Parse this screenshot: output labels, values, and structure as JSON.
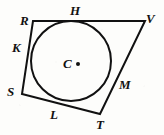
{
  "figure": {
    "background_color": "#fdfdfb",
    "stroke_color": "#111111",
    "canvas": {
      "width": 164,
      "height": 135
    }
  },
  "chart_data": {
    "type": "diagram",
    "shapes": [
      {
        "name": "circle",
        "kind": "circle",
        "center": [
          71,
          61
        ],
        "radius": 40,
        "stroke": "#111111",
        "stroke_width": 2,
        "fill": "none"
      },
      {
        "name": "quadrilateral",
        "kind": "polygon",
        "vertices": [
          [
            33,
            21
          ],
          [
            145,
            21
          ],
          [
            100,
            114
          ],
          [
            22,
            94
          ]
        ],
        "stroke": "#111111",
        "stroke_width": 2,
        "fill": "none"
      },
      {
        "name": "center-dot",
        "kind": "point",
        "position": [
          78,
          64
        ],
        "radius": 2,
        "fill": "#111111"
      }
    ],
    "points": [
      {
        "id": "R",
        "label": "R",
        "role": "vertex",
        "position": [
          33,
          21
        ],
        "label_position": [
          20,
          14
        ]
      },
      {
        "id": "H",
        "label": "H",
        "role": "tangent-point",
        "position": [
          77,
          21
        ],
        "label_position": [
          70,
          4
        ]
      },
      {
        "id": "V",
        "label": "V",
        "role": "vertex",
        "position": [
          145,
          21
        ],
        "label_position": [
          146,
          12
        ]
      },
      {
        "id": "K",
        "label": "K",
        "role": "tangent-point",
        "position": [
          31,
          49
        ],
        "label_position": [
          12,
          41
        ]
      },
      {
        "id": "C",
        "label": "C",
        "role": "center",
        "position": [
          71,
          61
        ],
        "label_position": [
          63,
          57
        ]
      },
      {
        "id": "M",
        "label": "M",
        "role": "tangent-point",
        "position": [
          113,
          84
        ],
        "label_position": [
          119,
          78
        ]
      },
      {
        "id": "S",
        "label": "S",
        "role": "vertex",
        "position": [
          22,
          94
        ],
        "label_position": [
          7,
          85
        ]
      },
      {
        "id": "L",
        "label": "L",
        "role": "tangent-point",
        "position": [
          60,
          100
        ],
        "label_position": [
          50,
          108
        ]
      },
      {
        "id": "T",
        "label": "T",
        "role": "vertex",
        "position": [
          100,
          114
        ],
        "label_position": [
          96,
          118
        ]
      }
    ],
    "edges": [
      {
        "name": "edge-RV",
        "from": "R",
        "to": "V",
        "tangent_at": "H"
      },
      {
        "name": "edge-VT",
        "from": "V",
        "to": "T",
        "tangent_at": "M"
      },
      {
        "name": "edge-TS",
        "from": "T",
        "to": "S",
        "tangent_at": "L"
      },
      {
        "name": "edge-SR",
        "from": "S",
        "to": "R",
        "tangent_at": "K"
      }
    ],
    "xlabel": "",
    "ylabel": "",
    "legend": []
  },
  "labels": {
    "R": "R",
    "H": "H",
    "V": "V",
    "K": "K",
    "C": "C",
    "M": "M",
    "S": "S",
    "L": "L",
    "T": "T"
  }
}
